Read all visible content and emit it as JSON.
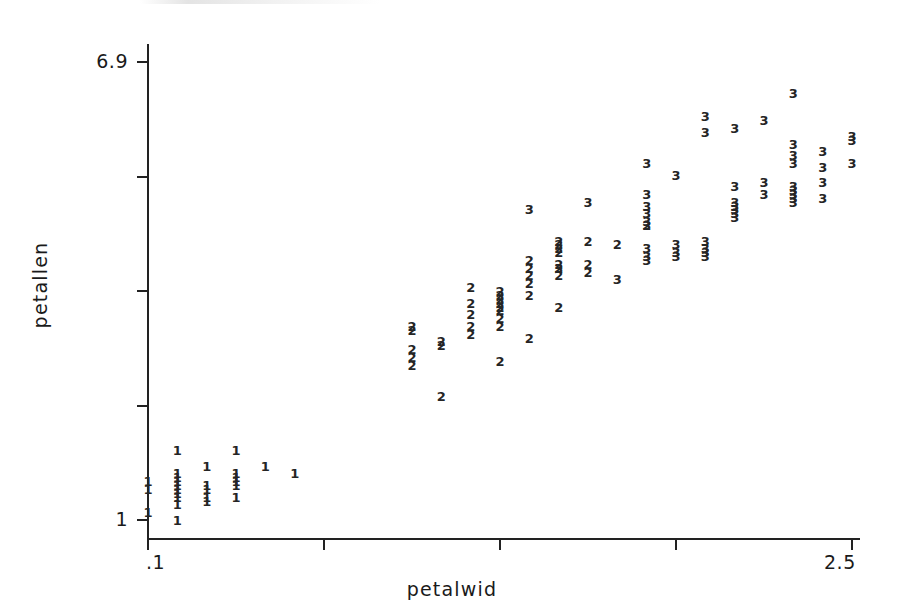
{
  "chart_data": {
    "type": "scatter",
    "title": "",
    "subtitle": "",
    "xlabel": "petalwid",
    "ylabel": "petallen",
    "xlim": [
      0.1,
      2.5
    ],
    "ylim": [
      1.0,
      6.9
    ],
    "grid": false,
    "legend": "none",
    "x_tick_labels": [
      "​.1",
      "",
      "",
      "",
      "2.5"
    ],
    "x_tick_values": [
      0.1,
      0.7,
      1.3,
      1.9,
      2.5
    ],
    "x_axis_tick_label_first": ".1",
    "x_axis_tick_label_last": "2.5",
    "y_tick_labels": [
      "1",
      "",
      "",
      "",
      "6.9"
    ],
    "y_tick_values": [
      1.0,
      2.475,
      3.95,
      5.425,
      6.9
    ],
    "y_axis_tick_label_bottom": "1",
    "y_axis_tick_label_top": "6.9",
    "marker_style": "group-label-digit",
    "group_labels": [
      "1",
      "2",
      "3"
    ],
    "note": "Each plotted mark is the digit of its class/group; overplotted points stack vertically.",
    "points": [
      {
        "g": "1",
        "x": 0.1,
        "y": 1.4
      },
      {
        "g": "1",
        "x": 0.1,
        "y": 1.5
      },
      {
        "g": "1",
        "x": 0.1,
        "y": 1.1
      },
      {
        "g": "1",
        "x": 0.2,
        "y": 1.9
      },
      {
        "g": "1",
        "x": 0.2,
        "y": 1.6
      },
      {
        "g": "1",
        "x": 0.2,
        "y": 1.55
      },
      {
        "g": "1",
        "x": 0.2,
        "y": 1.5
      },
      {
        "g": "1",
        "x": 0.2,
        "y": 1.45
      },
      {
        "g": "1",
        "x": 0.2,
        "y": 1.4
      },
      {
        "g": "1",
        "x": 0.2,
        "y": 1.35
      },
      {
        "g": "1",
        "x": 0.2,
        "y": 1.3
      },
      {
        "g": "1",
        "x": 0.2,
        "y": 1.2
      },
      {
        "g": "1",
        "x": 0.2,
        "y": 1.0
      },
      {
        "g": "1",
        "x": 0.3,
        "y": 1.7
      },
      {
        "g": "1",
        "x": 0.3,
        "y": 1.45
      },
      {
        "g": "1",
        "x": 0.3,
        "y": 1.4
      },
      {
        "g": "1",
        "x": 0.3,
        "y": 1.3
      },
      {
        "g": "1",
        "x": 0.3,
        "y": 1.25
      },
      {
        "g": "1",
        "x": 0.4,
        "y": 1.9
      },
      {
        "g": "1",
        "x": 0.4,
        "y": 1.6
      },
      {
        "g": "1",
        "x": 0.4,
        "y": 1.55
      },
      {
        "g": "1",
        "x": 0.4,
        "y": 1.5
      },
      {
        "g": "1",
        "x": 0.4,
        "y": 1.45
      },
      {
        "g": "1",
        "x": 0.4,
        "y": 1.3
      },
      {
        "g": "1",
        "x": 0.5,
        "y": 1.7
      },
      {
        "g": "1",
        "x": 0.6,
        "y": 1.6
      },
      {
        "g": "2",
        "x": 1.0,
        "y": 3.5
      },
      {
        "g": "2",
        "x": 1.0,
        "y": 3.45
      },
      {
        "g": "2",
        "x": 1.0,
        "y": 3.2
      },
      {
        "g": "2",
        "x": 1.0,
        "y": 3.1
      },
      {
        "g": "2",
        "x": 1.0,
        "y": 3.0
      },
      {
        "g": "2",
        "x": 1.1,
        "y": 3.3
      },
      {
        "g": "2",
        "x": 1.1,
        "y": 3.25
      },
      {
        "g": "2",
        "x": 1.1,
        "y": 2.6
      },
      {
        "g": "2",
        "x": 1.2,
        "y": 4.0
      },
      {
        "g": "2",
        "x": 1.2,
        "y": 3.8
      },
      {
        "g": "2",
        "x": 1.2,
        "y": 3.65
      },
      {
        "g": "2",
        "x": 1.2,
        "y": 3.5
      },
      {
        "g": "2",
        "x": 1.2,
        "y": 3.4
      },
      {
        "g": "2",
        "x": 1.3,
        "y": 3.95
      },
      {
        "g": "2",
        "x": 1.3,
        "y": 3.9
      },
      {
        "g": "2",
        "x": 1.3,
        "y": 3.85
      },
      {
        "g": "2",
        "x": 1.3,
        "y": 3.8
      },
      {
        "g": "2",
        "x": 1.3,
        "y": 3.75
      },
      {
        "g": "2",
        "x": 1.3,
        "y": 3.7
      },
      {
        "g": "2",
        "x": 1.3,
        "y": 3.6
      },
      {
        "g": "2",
        "x": 1.3,
        "y": 3.5
      },
      {
        "g": "2",
        "x": 1.3,
        "y": 3.05
      },
      {
        "g": "2",
        "x": 1.4,
        "y": 4.35
      },
      {
        "g": "2",
        "x": 1.4,
        "y": 4.25
      },
      {
        "g": "2",
        "x": 1.4,
        "y": 4.15
      },
      {
        "g": "2",
        "x": 1.4,
        "y": 4.05
      },
      {
        "g": "2",
        "x": 1.4,
        "y": 3.9
      },
      {
        "g": "2",
        "x": 1.4,
        "y": 3.35
      },
      {
        "g": "2",
        "x": 1.5,
        "y": 4.6
      },
      {
        "g": "2",
        "x": 1.5,
        "y": 4.55
      },
      {
        "g": "2",
        "x": 1.5,
        "y": 4.5
      },
      {
        "g": "2",
        "x": 1.5,
        "y": 4.45
      },
      {
        "g": "2",
        "x": 1.5,
        "y": 4.3
      },
      {
        "g": "2",
        "x": 1.5,
        "y": 4.25
      },
      {
        "g": "2",
        "x": 1.5,
        "y": 4.15
      },
      {
        "g": "2",
        "x": 1.5,
        "y": 3.75
      },
      {
        "g": "2",
        "x": 1.6,
        "y": 4.6
      },
      {
        "g": "2",
        "x": 1.6,
        "y": 4.3
      },
      {
        "g": "2",
        "x": 1.6,
        "y": 4.2
      },
      {
        "g": "2",
        "x": 1.7,
        "y": 4.55
      },
      {
        "g": "2",
        "x": 1.8,
        "y": 4.8
      },
      {
        "g": "3",
        "x": 1.4,
        "y": 5.0
      },
      {
        "g": "3",
        "x": 1.5,
        "y": 4.25
      },
      {
        "g": "3",
        "x": 1.6,
        "y": 5.1
      },
      {
        "g": "3",
        "x": 1.7,
        "y": 4.1
      },
      {
        "g": "3",
        "x": 1.8,
        "y": 5.6
      },
      {
        "g": "3",
        "x": 1.8,
        "y": 5.2
      },
      {
        "g": "3",
        "x": 1.8,
        "y": 5.05
      },
      {
        "g": "3",
        "x": 1.8,
        "y": 4.95
      },
      {
        "g": "3",
        "x": 1.8,
        "y": 4.85
      },
      {
        "g": "3",
        "x": 1.8,
        "y": 4.8
      },
      {
        "g": "3",
        "x": 1.8,
        "y": 4.5
      },
      {
        "g": "3",
        "x": 1.8,
        "y": 4.4
      },
      {
        "g": "3",
        "x": 1.8,
        "y": 4.35
      },
      {
        "g": "3",
        "x": 1.9,
        "y": 5.45
      },
      {
        "g": "3",
        "x": 1.9,
        "y": 4.55
      },
      {
        "g": "3",
        "x": 1.9,
        "y": 4.45
      },
      {
        "g": "3",
        "x": 1.9,
        "y": 4.4
      },
      {
        "g": "3",
        "x": 2.0,
        "y": 6.2
      },
      {
        "g": "3",
        "x": 2.0,
        "y": 6.0
      },
      {
        "g": "3",
        "x": 2.0,
        "y": 4.6
      },
      {
        "g": "3",
        "x": 2.0,
        "y": 4.5
      },
      {
        "g": "3",
        "x": 2.0,
        "y": 4.45
      },
      {
        "g": "3",
        "x": 2.0,
        "y": 4.4
      },
      {
        "g": "3",
        "x": 2.1,
        "y": 6.05
      },
      {
        "g": "3",
        "x": 2.1,
        "y": 5.3
      },
      {
        "g": "3",
        "x": 2.1,
        "y": 5.1
      },
      {
        "g": "3",
        "x": 2.1,
        "y": 5.05
      },
      {
        "g": "3",
        "x": 2.1,
        "y": 5.0
      },
      {
        "g": "3",
        "x": 2.1,
        "y": 4.95
      },
      {
        "g": "3",
        "x": 2.1,
        "y": 4.9
      },
      {
        "g": "3",
        "x": 2.2,
        "y": 6.15
      },
      {
        "g": "3",
        "x": 2.2,
        "y": 5.35
      },
      {
        "g": "3",
        "x": 2.2,
        "y": 5.2
      },
      {
        "g": "3",
        "x": 2.3,
        "y": 6.5
      },
      {
        "g": "3",
        "x": 2.3,
        "y": 5.85
      },
      {
        "g": "3",
        "x": 2.3,
        "y": 5.7
      },
      {
        "g": "3",
        "x": 2.3,
        "y": 5.6
      },
      {
        "g": "3",
        "x": 2.3,
        "y": 5.3
      },
      {
        "g": "3",
        "x": 2.3,
        "y": 5.25
      },
      {
        "g": "3",
        "x": 2.3,
        "y": 5.2
      },
      {
        "g": "3",
        "x": 2.3,
        "y": 5.15
      },
      {
        "g": "3",
        "x": 2.3,
        "y": 5.1
      },
      {
        "g": "3",
        "x": 2.4,
        "y": 5.75
      },
      {
        "g": "3",
        "x": 2.4,
        "y": 5.55
      },
      {
        "g": "3",
        "x": 2.4,
        "y": 5.35
      },
      {
        "g": "3",
        "x": 2.4,
        "y": 5.15
      },
      {
        "g": "3",
        "x": 2.5,
        "y": 5.95
      },
      {
        "g": "3",
        "x": 2.5,
        "y": 5.9
      },
      {
        "g": "3",
        "x": 2.5,
        "y": 5.6
      }
    ]
  },
  "axes": {
    "y_title": "petallen",
    "x_title": "petalwid",
    "y_labels": [
      {
        "text": "6.9",
        "value": 6.9
      },
      {
        "text": "",
        "value": 5.425
      },
      {
        "text": "",
        "value": 3.95
      },
      {
        "text": "",
        "value": 2.475
      },
      {
        "text": "1",
        "value": 1.0
      }
    ],
    "x_labels": [
      {
        "text": ".1",
        "value": 0.1
      },
      {
        "text": "",
        "value": 0.7
      },
      {
        "text": "",
        "value": 1.3
      },
      {
        "text": "",
        "value": 1.9
      },
      {
        "text": "2.5",
        "value": 2.5
      }
    ]
  },
  "style": {
    "axis_color": "#222222",
    "mark_color": "#252525",
    "background": "#ffffff"
  }
}
